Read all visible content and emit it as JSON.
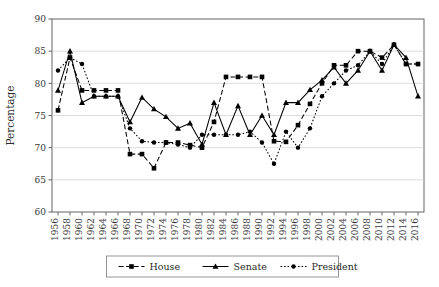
{
  "chart_data": {
    "type": "line",
    "title": "",
    "xlabel": "",
    "ylabel": "Percentage",
    "ylim": [
      60,
      90
    ],
    "ytick_step": 5,
    "yticks": [
      60,
      65,
      70,
      75,
      80,
      85,
      90
    ],
    "grid": true,
    "grid_axis": "y",
    "legend_position": "bottom",
    "categories": [
      "1956",
      "1958",
      "1960",
      "1962",
      "1964",
      "1966",
      "1968",
      "1970",
      "1972",
      "1974",
      "1976",
      "1978",
      "1980",
      "1982",
      "1984",
      "1986",
      "1988",
      "1990",
      "1992",
      "1994",
      "1996",
      "1998",
      "2000",
      "2002",
      "2004",
      "2006",
      "2008",
      "2010",
      "2012",
      "2014",
      "2016"
    ],
    "series": [
      {
        "name": "House",
        "line_style": "dashed",
        "marker": "square",
        "color": "#000000",
        "values": [
          75.8,
          84.0,
          78.9,
          78.9,
          78.9,
          78.9,
          69.0,
          69.0,
          66.8,
          70.8,
          70.8,
          70.4,
          70.0,
          74.0,
          81.0,
          81.0,
          81.0,
          81.0,
          71.0,
          70.9,
          73.5,
          76.8,
          80.0,
          82.8,
          82.8,
          85.0,
          85.0,
          84.0,
          86.0,
          83.0,
          83.0
        ]
      },
      {
        "name": "Senate",
        "line_style": "solid",
        "marker": "triangle",
        "color": "#000000",
        "values": [
          78.9,
          85.0,
          77.0,
          78.0,
          78.0,
          78.0,
          74.0,
          77.8,
          76.0,
          74.8,
          73.0,
          73.8,
          70.5,
          77.0,
          72.0,
          76.5,
          72.0,
          75.0,
          72.0,
          77.0,
          77.0,
          79.0,
          80.5,
          82.5,
          80.0,
          82.0,
          85.0,
          82.0,
          86.0,
          84.0,
          78.0
        ]
      },
      {
        "name": "President",
        "line_style": "dotted",
        "marker": "circle",
        "color": "#000000",
        "values": [
          82.0,
          84.0,
          83.0,
          78.0,
          78.0,
          78.0,
          73.0,
          71.0,
          70.8,
          70.8,
          70.5,
          70.0,
          72.0,
          72.0,
          72.0,
          72.0,
          72.5,
          70.8,
          67.5,
          72.5,
          70.0,
          73.0,
          78.0,
          80.0,
          82.0,
          82.8,
          85.0,
          83.0,
          86.0,
          83.0,
          83.0
        ]
      }
    ]
  },
  "legend": {
    "items": [
      {
        "label": "House",
        "style": "dashed",
        "marker": "square"
      },
      {
        "label": "Senate",
        "style": "solid",
        "marker": "triangle"
      },
      {
        "label": "President",
        "style": "dotted",
        "marker": "circle"
      }
    ]
  },
  "axes": {
    "y_axis_title": "Percentage",
    "y_min": 60,
    "y_max": 90
  }
}
